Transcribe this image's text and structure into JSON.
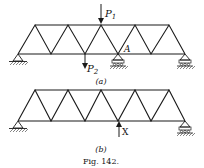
{
  "figure": {
    "caption": "Fig. 142.",
    "colors": {
      "ink": "#1a1a1a",
      "background": "#ffffff"
    }
  },
  "panel_a": {
    "label": "(a)",
    "loads": [
      {
        "name": "P",
        "sub": "1",
        "direction": "down",
        "node": "top-3"
      },
      {
        "name": "P",
        "sub": "2",
        "direction": "down",
        "node": "bottom-2"
      }
    ],
    "node_label": "A",
    "supports": [
      "pin-left",
      "roller-middle",
      "roller-right"
    ]
  },
  "panel_b": {
    "label": "(b)",
    "reaction": {
      "name": "X",
      "direction": "up",
      "node": "bottom-3"
    },
    "supports": [
      "pin-left",
      "roller-right"
    ]
  }
}
